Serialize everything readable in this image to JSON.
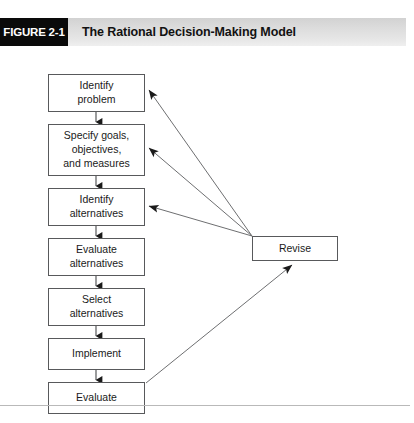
{
  "figure": {
    "tab_label": "FIGURE 2-1",
    "title": "The Rational Decision-Making Model"
  },
  "colors": {
    "tab_background": "#0a0a0a",
    "tab_text": "#ffffff",
    "title_band": "#dcdcdc",
    "title_text": "#121212",
    "box_border": "#58595b",
    "box_fill": "#ffffff",
    "connector": "#58595b",
    "arrowhead": "#1a1a1a",
    "footer_rule": "#b9b9b9"
  },
  "diagram": {
    "type": "flowchart",
    "orientation": "vertical-with-feedback-loop",
    "main_steps": [
      {
        "id": "identify-problem",
        "label": "Identify\nproblem",
        "x": 48,
        "y": 28,
        "width": 97,
        "height": 38
      },
      {
        "id": "specify-goals",
        "label": "Specify goals,\nobjectives,\nand measures",
        "x": 48,
        "y": 78,
        "width": 97,
        "height": 52
      },
      {
        "id": "identify-alternatives",
        "label": "Identify\nalternatives",
        "x": 48,
        "y": 142,
        "width": 97,
        "height": 38
      },
      {
        "id": "evaluate-alternatives",
        "label": "Evaluate\nalternatives",
        "x": 48,
        "y": 192,
        "width": 97,
        "height": 38
      },
      {
        "id": "select-alternatives",
        "label": "Select\nalternatives",
        "x": 48,
        "y": 242,
        "width": 97,
        "height": 38
      },
      {
        "id": "implement",
        "label": "Implement",
        "x": 48,
        "y": 292,
        "width": 97,
        "height": 32
      },
      {
        "id": "evaluate",
        "label": "Evaluate",
        "x": 48,
        "y": 336,
        "width": 97,
        "height": 32
      }
    ],
    "side_step": {
      "id": "revise",
      "label": "Revise",
      "x": 252,
      "y": 190,
      "width": 86,
      "height": 25
    },
    "sequence_connectors": [
      {
        "from": "identify-problem",
        "to": "specify-goals",
        "x": 96,
        "y1": 66,
        "y2": 78
      },
      {
        "from": "specify-goals",
        "to": "identify-alternatives",
        "x": 96,
        "y1": 130,
        "y2": 142
      },
      {
        "from": "identify-alternatives",
        "to": "evaluate-alternatives",
        "x": 96,
        "y1": 180,
        "y2": 192
      },
      {
        "from": "evaluate-alternatives",
        "to": "select-alternatives",
        "x": 96,
        "y1": 230,
        "y2": 242
      },
      {
        "from": "select-alternatives",
        "to": "implement",
        "x": 96,
        "y1": 280,
        "y2": 292
      },
      {
        "from": "implement",
        "to": "evaluate",
        "x": 96,
        "y1": 324,
        "y2": 336
      }
    ],
    "feedback_connectors": [
      {
        "from": "revise",
        "to": "identify-problem",
        "x1": 252,
        "y1": 190,
        "x2": 147,
        "y2": 44
      },
      {
        "from": "revise",
        "to": "specify-goals",
        "x1": 252,
        "y1": 190,
        "x2": 147,
        "y2": 102
      },
      {
        "from": "revise",
        "to": "identify-alternatives",
        "x1": 252,
        "y1": 190,
        "x2": 147,
        "y2": 160
      },
      {
        "from": "evaluate",
        "to": "revise",
        "x1": 146,
        "y1": 336,
        "x2": 292,
        "y2": 217
      }
    ]
  }
}
